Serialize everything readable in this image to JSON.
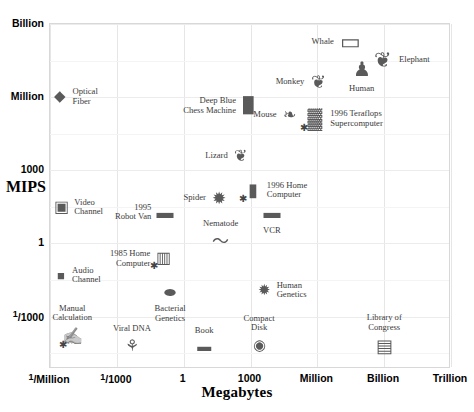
{
  "chart_data": {
    "type": "scatter",
    "title": "",
    "xlabel": "Megabytes",
    "ylabel": "MIPS",
    "xticks": [
      "1/Million",
      "1/1000",
      "1",
      "1000",
      "Million",
      "Billion",
      "Trillion"
    ],
    "yticks": [
      "Billion",
      "Million",
      "1000",
      "1",
      "1/1000"
    ],
    "xlim_labels": [
      "1/Million",
      "Trillion"
    ],
    "ylim_labels": [
      "1/1000",
      "Billion"
    ],
    "grid": true,
    "legend": "none",
    "points": [
      {
        "label": "Optical\nFiber",
        "x": 0.028,
        "y": 0.788,
        "glyph": "◆",
        "size": 15,
        "lpos": "right",
        "star": false
      },
      {
        "label": "Video\nChannel",
        "x": 0.031,
        "y": 0.467,
        "glyph": "▣",
        "size": 16,
        "lpos": "right",
        "star": false
      },
      {
        "label": "Audio\nChannel",
        "x": 0.03,
        "y": 0.27,
        "glyph": "■",
        "size": 13,
        "lpos": "right",
        "star": false
      },
      {
        "label": "Manual\nCalculation",
        "x": 0.058,
        "y": 0.092,
        "glyph": "✍",
        "size": 17,
        "lpos": "above",
        "star": true
      },
      {
        "label": "Viral DNA",
        "x": 0.207,
        "y": 0.065,
        "glyph": "⚘",
        "size": 16,
        "lpos": "above",
        "star": false
      },
      {
        "label": "1985 Home\nComputer",
        "x": 0.285,
        "y": 0.318,
        "glyph": "▥",
        "size": 16,
        "lpos": "left",
        "star": true
      },
      {
        "label": "Bacterial\nGenetics",
        "x": 0.302,
        "y": 0.218,
        "glyph": "⬬",
        "size": 14,
        "lpos": "below",
        "star": false
      },
      {
        "label": "1995\nRobot Van",
        "x": 0.289,
        "y": 0.452,
        "glyph": "▬",
        "size": 17,
        "lpos": "left",
        "star": false
      },
      {
        "label": "Book",
        "x": 0.387,
        "y": 0.062,
        "glyph": "▬",
        "size": 14,
        "lpos": "above",
        "star": false
      },
      {
        "label": "Spider",
        "x": 0.425,
        "y": 0.494,
        "glyph": "✹",
        "size": 17,
        "lpos": "left",
        "star": false
      },
      {
        "label": "Nematode",
        "x": 0.428,
        "y": 0.367,
        "glyph": "〜",
        "size": 17,
        "lpos": "above",
        "star": false
      },
      {
        "label": "Lizard",
        "x": 0.478,
        "y": 0.614,
        "glyph": "❦",
        "size": 16,
        "lpos": "left",
        "star": false
      },
      {
        "label": "1996 Home\nComputer",
        "x": 0.508,
        "y": 0.516,
        "glyph": "▮",
        "size": 18,
        "lpos": "right",
        "star": true
      },
      {
        "label": "VCR",
        "x": 0.556,
        "y": 0.452,
        "glyph": "▬",
        "size": 17,
        "lpos": "below",
        "star": false
      },
      {
        "label": "Compact\nDisk",
        "x": 0.524,
        "y": 0.066,
        "glyph": "◉",
        "size": 15,
        "lpos": "above",
        "star": false
      },
      {
        "label": "Human\nGenetics",
        "x": 0.537,
        "y": 0.226,
        "glyph": "✹",
        "size": 15,
        "lpos": "right",
        "star": false
      },
      {
        "label": "Deep Blue\nChess Machine",
        "x": 0.497,
        "y": 0.762,
        "glyph": "█",
        "size": 15,
        "lpos": "left",
        "star": false
      },
      {
        "label": "Mouse",
        "x": 0.6,
        "y": 0.734,
        "glyph": "❧",
        "size": 16,
        "lpos": "left",
        "star": false
      },
      {
        "label": "1996 Teraflops\nSupercomputer",
        "x": 0.663,
        "y": 0.724,
        "glyph": "▓",
        "size": 20,
        "lpos": "right",
        "star": true
      },
      {
        "label": "Monkey",
        "x": 0.672,
        "y": 0.83,
        "glyph": "❦",
        "size": 18,
        "lpos": "left",
        "star": false
      },
      {
        "label": "Whale",
        "x": 0.752,
        "y": 0.945,
        "glyph": "▭",
        "size": 22,
        "lpos": "left",
        "star": false
      },
      {
        "label": "Human",
        "x": 0.78,
        "y": 0.868,
        "glyph": "♟",
        "size": 20,
        "lpos": "below",
        "star": false
      },
      {
        "label": "Elephant",
        "x": 0.833,
        "y": 0.893,
        "glyph": "❦",
        "size": 21,
        "lpos": "right",
        "star": false
      },
      {
        "label": "Library of\nCongress",
        "x": 0.836,
        "y": 0.063,
        "glyph": "▤",
        "size": 18,
        "lpos": "above",
        "star": false
      }
    ]
  },
  "axes": {
    "x_title": "Megabytes",
    "y_title": "MIPS",
    "x_labels": [
      {
        "text": "1/Million",
        "num": "1",
        "den": "Million",
        "frac": true,
        "pos": 0.0
      },
      {
        "text": "1/1000",
        "num": "1",
        "den": "1000",
        "frac": true,
        "pos": 0.1667
      },
      {
        "text": "1",
        "num": "",
        "den": "1",
        "frac": false,
        "pos": 0.3333
      },
      {
        "text": "1000",
        "num": "",
        "den": "1000",
        "frac": false,
        "pos": 0.5
      },
      {
        "text": "Million",
        "num": "",
        "den": "Million",
        "frac": false,
        "pos": 0.6667
      },
      {
        "text": "Billion",
        "num": "",
        "den": "Billion",
        "frac": false,
        "pos": 0.8333
      },
      {
        "text": "Trillion",
        "num": "",
        "den": "Trillion",
        "frac": false,
        "pos": 1.0
      }
    ],
    "y_labels": [
      {
        "text": "Billion",
        "num": "",
        "den": "Billion",
        "frac": false,
        "pos": 1.0
      },
      {
        "text": "Million",
        "num": "",
        "den": "Million",
        "frac": false,
        "pos": 0.788
      },
      {
        "text": "1000",
        "num": "",
        "den": "1000",
        "frac": false,
        "pos": 0.576
      },
      {
        "text": "1",
        "num": "",
        "den": "1",
        "frac": false,
        "pos": 0.364
      },
      {
        "text": "1/1000",
        "num": "1",
        "den": "1000",
        "frac": true,
        "pos": 0.152
      }
    ]
  },
  "colors": {
    "background": "#ffffff",
    "grid_major": "#e6e6e6",
    "grid_minor": "#f4f4f4",
    "frame": "#d8d8d8",
    "label_text": "#3a3a3a",
    "tick_text": "#000000",
    "glyph": "#5a5a5a"
  }
}
